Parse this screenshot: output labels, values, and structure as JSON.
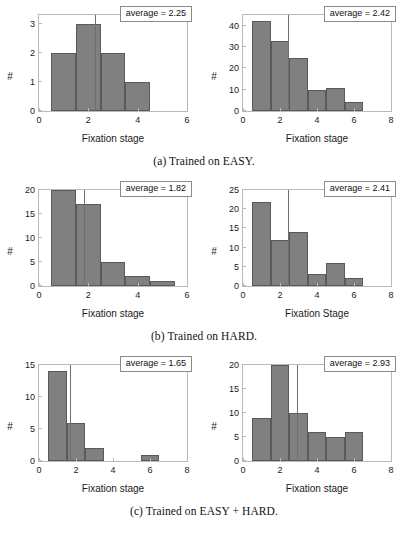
{
  "figure": {
    "rows": [
      {
        "caption": "(a) Trained on EASY.",
        "panels": [
          {
            "name": "easy-trained-easy-test",
            "average_label": "average = 2.25",
            "chart_data": {
              "type": "bar",
              "title": "",
              "xlabel": "Fixation stage",
              "ylabel": "#",
              "xlim": [
                0,
                6
              ],
              "ylim": [
                0,
                3.3
              ],
              "xticks": [
                0,
                2,
                4,
                6
              ],
              "xticklabels": [
                "0",
                "2",
                "4",
                "6"
              ],
              "yticks": [
                0,
                1,
                2,
                3
              ],
              "yticklabels": [
                "0",
                "1",
                "2",
                "3"
              ],
              "grid": false,
              "bin_edges": [
                0.5,
                1.5,
                2.5,
                3.5,
                4.5
              ],
              "values": [
                2,
                3,
                2,
                1
              ],
              "average": 2.25
            }
          },
          {
            "name": "easy-trained-hard-test",
            "average_label": "average = 2.42",
            "chart_data": {
              "type": "bar",
              "title": "",
              "xlabel": "Fixation stage",
              "ylabel": "#",
              "xlim": [
                0,
                8
              ],
              "ylim": [
                0,
                45
              ],
              "xticks": [
                0,
                2,
                4,
                6,
                8
              ],
              "xticklabels": [
                "0",
                "2",
                "4",
                "6",
                "8"
              ],
              "yticks": [
                0,
                10,
                20,
                30,
                40
              ],
              "yticklabels": [
                "0",
                "10",
                "20",
                "30",
                "40"
              ],
              "grid": false,
              "bin_edges": [
                0.5,
                1.5,
                2.5,
                3.5,
                4.5,
                5.5,
                6.5
              ],
              "values": [
                42,
                33,
                25,
                10,
                11,
                4
              ],
              "average": 2.42
            }
          }
        ]
      },
      {
        "caption": "(b) Trained on HARD.",
        "panels": [
          {
            "name": "hard-trained-easy-test",
            "average_label": "average = 1.82",
            "chart_data": {
              "type": "bar",
              "title": "",
              "xlabel": "Fixation stage",
              "ylabel": "#",
              "xlim": [
                0,
                6
              ],
              "ylim": [
                0,
                20
              ],
              "xticks": [
                0,
                2,
                4,
                6
              ],
              "xticklabels": [
                "0",
                "2",
                "4",
                "6"
              ],
              "yticks": [
                0,
                5,
                10,
                15,
                20
              ],
              "yticklabels": [
                "0",
                "5",
                "10",
                "15",
                "20"
              ],
              "grid": false,
              "bin_edges": [
                0.5,
                1.5,
                2.5,
                3.5,
                4.5,
                5.5
              ],
              "values": [
                20,
                17,
                5,
                2,
                1
              ],
              "average": 1.82
            }
          },
          {
            "name": "hard-trained-hard-test",
            "average_label": "average = 2.41",
            "chart_data": {
              "type": "bar",
              "title": "",
              "xlabel": "Fixation Stage",
              "ylabel": "#",
              "xlim": [
                0,
                8
              ],
              "ylim": [
                0,
                25
              ],
              "xticks": [
                0,
                2,
                4,
                6,
                8
              ],
              "xticklabels": [
                "0",
                "2",
                "4",
                "6",
                "8"
              ],
              "yticks": [
                0,
                5,
                10,
                15,
                20,
                25
              ],
              "yticklabels": [
                "0",
                "5",
                "10",
                "15",
                "20",
                "25"
              ],
              "grid": false,
              "bin_edges": [
                0.5,
                1.5,
                2.5,
                3.5,
                4.5,
                5.5,
                6.5
              ],
              "values": [
                22,
                12,
                14,
                3,
                6,
                2
              ],
              "average": 2.41
            }
          }
        ]
      },
      {
        "caption": "(c) Trained on EASY + HARD.",
        "panels": [
          {
            "name": "easyhard-trained-easy-test",
            "average_label": "average = 1.65",
            "chart_data": {
              "type": "bar",
              "title": "",
              "xlabel": "Fixation stage",
              "ylabel": "#",
              "xlim": [
                0,
                8
              ],
              "ylim": [
                0,
                15
              ],
              "xticks": [
                0,
                2,
                4,
                6,
                8
              ],
              "xticklabels": [
                "0",
                "2",
                "4",
                "6",
                "8"
              ],
              "yticks": [
                0,
                5,
                10,
                15
              ],
              "yticklabels": [
                "0",
                "5",
                "10",
                "15"
              ],
              "grid": false,
              "bin_edges": [
                0.5,
                1.5,
                2.5,
                3.5,
                4.5,
                5.5,
                6.5
              ],
              "values": [
                14,
                6,
                2,
                0,
                0,
                1
              ],
              "average": 1.65
            }
          },
          {
            "name": "easyhard-trained-hard-test",
            "average_label": "average = 2.93",
            "chart_data": {
              "type": "bar",
              "title": "",
              "xlabel": "Fixation stage",
              "ylabel": "#",
              "xlim": [
                0,
                8
              ],
              "ylim": [
                0,
                20
              ],
              "xticks": [
                0,
                2,
                4,
                6,
                8
              ],
              "xticklabels": [
                "0",
                "2",
                "4",
                "6",
                "8"
              ],
              "yticks": [
                0,
                5,
                10,
                15,
                20
              ],
              "yticklabels": [
                "0",
                "5",
                "10",
                "15",
                "20"
              ],
              "grid": false,
              "bin_edges": [
                0.5,
                1.5,
                2.5,
                3.5,
                4.5,
                5.5,
                6.5
              ],
              "values": [
                9,
                20,
                10,
                6,
                5,
                6
              ],
              "average": 2.93
            }
          }
        ]
      }
    ],
    "colors": {
      "bar_fill": "#808080",
      "bar_edge": "#5a5a5a",
      "axis": "#b9b9b9",
      "avg_line": "#6e6e6e",
      "text": "#111111"
    }
  }
}
